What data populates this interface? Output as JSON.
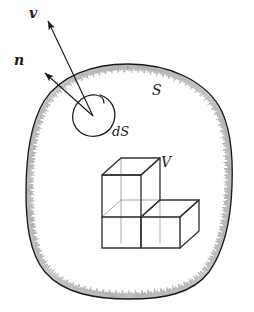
{
  "figure": {
    "background_color": "#ffffff",
    "ink_color": "#1a1a1a",
    "cube_edge_color": "#333333",
    "cube_hidden_edge_color": "#8a8a8a",
    "hatch_color": "#555555"
  },
  "labels": {
    "velocity_vector": "v",
    "normal_vector": "n",
    "surface": "S",
    "surface_element": "dS",
    "volume": "V"
  },
  "annotations": {
    "velocity_arrow_name": "velocity-vector-arrow",
    "normal_arrow_name": "normal-vector-arrow",
    "surface_boundary_name": "closed-surface-boundary",
    "surface_element_name": "surface-element-loop",
    "volume_solid_name": "volume-cube-cluster"
  },
  "geometry": {
    "surface_boundary_extent": {
      "left_px": 26,
      "top_px": 64,
      "right_px": 233,
      "bottom_px": 299
    },
    "surface_element_center": {
      "x_px": 92,
      "y_px": 113
    },
    "velocity_arrow": {
      "tail_x_px": 93,
      "tail_y_px": 116,
      "tip_x_px": 47,
      "tip_y_px": 20
    },
    "normal_arrow": {
      "tail_x_px": 93,
      "tail_y_px": 116,
      "tip_x_px": 44,
      "tip_y_px": 72
    },
    "cube_cluster_extent": {
      "left_px": 102,
      "top_px": 158,
      "right_px": 186,
      "bottom_px": 248
    },
    "cube_layout": {
      "description": "L-shaped cluster: two unit cubes in the bottom row, one unit cube stacked on the bottom-left cube",
      "bottom_row_count": 2,
      "top_row_count": 1
    }
  }
}
